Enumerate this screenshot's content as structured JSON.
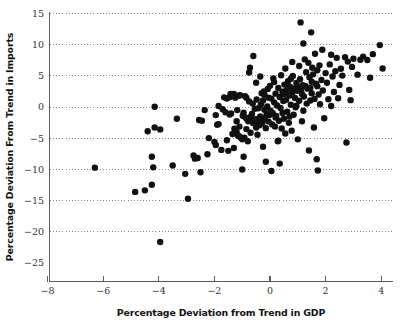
{
  "chart_data": {
    "type": "scatter",
    "title": "",
    "xlabel": "Percentage Deviation from Trend in GDP",
    "ylabel": "Percentage Deviation From Trend in Imports",
    "xlim": [
      -8,
      4.7
    ],
    "ylim": [
      -25,
      15.8
    ],
    "xticks": [
      -8,
      -6,
      -4,
      -2,
      0,
      2,
      4
    ],
    "xticklabels": [
      "−8",
      "−6",
      "−4",
      "−2",
      "0",
      "2",
      "4"
    ],
    "yticks": [
      15,
      10,
      5,
      0,
      -5,
      -10,
      -15,
      -20,
      -25
    ],
    "yticklabels": [
      "15",
      "10",
      "5",
      "0",
      "−5",
      "−10",
      "−15",
      "−20",
      "−25"
    ],
    "grid": "horizontal-dotted",
    "gridded_values": [
      15,
      10,
      5,
      0,
      -5,
      -10,
      -15,
      -20
    ],
    "legend": "none",
    "marker": "filled-circle",
    "marker_color": "#111111",
    "marker_size_px": 3.2,
    "n_points": 233,
    "points": [
      [
        -6.3,
        -9.75
      ],
      [
        -4.85,
        -13.65
      ],
      [
        -4.5,
        -13.4
      ],
      [
        -4.25,
        -12.5
      ],
      [
        -4.15,
        -3.3
      ],
      [
        -4.4,
        -3.9
      ],
      [
        -4.15,
        0.05
      ],
      [
        -4.2,
        -9.7
      ],
      [
        -4.25,
        -8.0
      ],
      [
        -3.95,
        -21.7
      ],
      [
        -3.95,
        -3.6
      ],
      [
        -3.5,
        -9.4
      ],
      [
        -3.35,
        -1.9
      ],
      [
        -3.05,
        -10.75
      ],
      [
        -2.95,
        -14.75
      ],
      [
        -2.75,
        -7.8
      ],
      [
        -2.7,
        -8.3
      ],
      [
        -2.6,
        -8.2
      ],
      [
        -2.55,
        -2.1
      ],
      [
        -2.5,
        -10.5
      ],
      [
        -2.35,
        -0.5
      ],
      [
        -2.25,
        -7.6
      ],
      [
        -2.0,
        -5.6
      ],
      [
        -1.95,
        -1.3
      ],
      [
        -1.9,
        -2.85
      ],
      [
        -1.85,
        -2.75
      ],
      [
        -1.75,
        -6.9
      ],
      [
        -1.7,
        -0.35
      ],
      [
        -1.65,
        1.55
      ],
      [
        -1.6,
        -0.85
      ],
      [
        -1.55,
        -5.35
      ],
      [
        -1.5,
        -7.05
      ],
      [
        -1.45,
        1.6
      ],
      [
        -1.42,
        2.1
      ],
      [
        -1.4,
        -1.05
      ],
      [
        -1.35,
        -4.35
      ],
      [
        -1.3,
        -6.6
      ],
      [
        -1.28,
        -3.5
      ],
      [
        -1.25,
        1.5
      ],
      [
        -1.2,
        -4.0
      ],
      [
        -1.18,
        -0.5
      ],
      [
        -1.15,
        -4.6
      ],
      [
        -1.12,
        -4.7
      ],
      [
        -1.1,
        1.85
      ],
      [
        -1.08,
        1.9
      ],
      [
        -1.05,
        -4.9
      ],
      [
        -1.0,
        -5.2
      ],
      [
        -0.98,
        -1.4
      ],
      [
        -1.0,
        -10.05
      ],
      [
        -0.95,
        -8.0
      ],
      [
        -0.92,
        -4.95
      ],
      [
        -0.9,
        1.75
      ],
      [
        -0.88,
        -1.7
      ],
      [
        -0.85,
        1.5
      ],
      [
        -0.82,
        -2.0
      ],
      [
        -0.8,
        -5.5
      ],
      [
        -0.78,
        -2.3
      ],
      [
        -0.75,
        5.55
      ],
      [
        -0.72,
        6.3
      ],
      [
        -0.7,
        -1.6
      ],
      [
        -0.68,
        -2.1
      ],
      [
        -0.65,
        -1.1
      ],
      [
        -0.62,
        0.55
      ],
      [
        -0.6,
        -2.6
      ],
      [
        -0.58,
        -2.4
      ],
      [
        -0.55,
        -2.5
      ],
      [
        -0.52,
        -1.95
      ],
      [
        -0.5,
        -3.3
      ],
      [
        -0.48,
        1.2
      ],
      [
        -0.45,
        -2.2
      ],
      [
        -0.42,
        -0.2
      ],
      [
        -0.4,
        -1.85
      ],
      [
        -0.38,
        -2.95
      ],
      [
        -0.35,
        -1.5
      ],
      [
        -0.33,
        0.4
      ],
      [
        -0.3,
        -1.75
      ],
      [
        -0.28,
        -2.65
      ],
      [
        -0.25,
        1.05
      ],
      [
        -0.22,
        2.5
      ],
      [
        -0.2,
        -0.45
      ],
      [
        -0.18,
        -2.0
      ],
      [
        -0.15,
        -3.4
      ],
      [
        -0.12,
        -1.15
      ],
      [
        -0.1,
        0.1
      ],
      [
        -0.08,
        2.9
      ],
      [
        -0.05,
        -2.35
      ],
      [
        -0.02,
        -1.3
      ],
      [
        0.0,
        3.4
      ],
      [
        0.02,
        -0.6
      ],
      [
        0.05,
        1.35
      ],
      [
        0.08,
        -2.8
      ],
      [
        0.1,
        -1.0
      ],
      [
        0.12,
        4.6
      ],
      [
        0.15,
        0.75
      ],
      [
        0.18,
        -3.15
      ],
      [
        0.2,
        2.15
      ],
      [
        0.22,
        -1.45
      ],
      [
        0.25,
        0.25
      ],
      [
        0.28,
        -5.5
      ],
      [
        0.3,
        3.05
      ],
      [
        0.32,
        -2.2
      ],
      [
        0.35,
        1.6
      ],
      [
        0.38,
        -0.15
      ],
      [
        0.4,
        5.1
      ],
      [
        0.42,
        -3.45
      ],
      [
        0.45,
        2.45
      ],
      [
        0.48,
        0.95
      ],
      [
        0.5,
        -1.9
      ],
      [
        0.52,
        3.6
      ],
      [
        0.55,
        -4.25
      ],
      [
        0.58,
        1.15
      ],
      [
        0.6,
        2.75
      ],
      [
        0.62,
        -0.75
      ],
      [
        0.65,
        4.15
      ],
      [
        0.68,
        -2.55
      ],
      [
        0.7,
        1.85
      ],
      [
        0.72,
        3.25
      ],
      [
        0.75,
        0.35
      ],
      [
        0.78,
        -3.8
      ],
      [
        0.8,
        2.35
      ],
      [
        0.82,
        5.0
      ],
      [
        0.85,
        -1.25
      ],
      [
        0.88,
        3.0
      ],
      [
        0.9,
        1.45
      ],
      [
        0.92,
        -0.05
      ],
      [
        0.95,
        3.85
      ],
      [
        0.98,
        2.6
      ],
      [
        1.0,
        -5.2
      ],
      [
        1.02,
        3.2
      ],
      [
        1.05,
        1.0
      ],
      [
        1.08,
        4.45
      ],
      [
        1.1,
        13.6
      ],
      [
        1.12,
        2.85
      ],
      [
        1.15,
        -2.3
      ],
      [
        1.18,
        3.5
      ],
      [
        1.2,
        10.2
      ],
      [
        1.22,
        1.7
      ],
      [
        1.25,
        7.65
      ],
      [
        1.28,
        3.35
      ],
      [
        1.3,
        5.6
      ],
      [
        1.32,
        0.55
      ],
      [
        1.35,
        2.95
      ],
      [
        1.38,
        7.1
      ],
      [
        1.4,
        -7.0
      ],
      [
        1.42,
        4.8
      ],
      [
        1.45,
        3.1
      ],
      [
        1.48,
        12.0
      ],
      [
        1.5,
        2.2
      ],
      [
        1.52,
        6.3
      ],
      [
        1.55,
        5.25
      ],
      [
        1.58,
        -3.3
      ],
      [
        1.6,
        1.3
      ],
      [
        1.62,
        8.55
      ],
      [
        1.65,
        3.75
      ],
      [
        1.68,
        -8.4
      ],
      [
        1.7,
        5.9
      ],
      [
        1.72,
        -10.2
      ],
      [
        1.75,
        2.0
      ],
      [
        1.78,
        6.7
      ],
      [
        1.8,
        0.45
      ],
      [
        1.85,
        4.35
      ],
      [
        1.88,
        9.2
      ],
      [
        1.9,
        2.65
      ],
      [
        1.95,
        -1.8
      ],
      [
        2.0,
        5.45
      ],
      [
        2.05,
        3.9
      ],
      [
        2.1,
        1.25
      ],
      [
        2.15,
        6.85
      ],
      [
        2.2,
        0.15
      ],
      [
        2.25,
        4.9
      ],
      [
        2.3,
        2.4
      ],
      [
        2.35,
        5.75
      ],
      [
        2.4,
        7.9
      ],
      [
        2.5,
        3.55
      ],
      [
        2.55,
        6.15
      ],
      [
        2.6,
        5.05
      ],
      [
        2.7,
        8.0
      ],
      [
        2.75,
        -5.7
      ],
      [
        2.8,
        7.3
      ],
      [
        2.85,
        2.75
      ],
      [
        2.9,
        1.1
      ],
      [
        2.95,
        6.45
      ],
      [
        3.0,
        7.75
      ],
      [
        3.15,
        5.2
      ],
      [
        3.25,
        7.6
      ],
      [
        3.35,
        8.1
      ],
      [
        3.5,
        7.55
      ],
      [
        3.6,
        4.7
      ],
      [
        3.7,
        8.5
      ],
      [
        3.95,
        9.95
      ],
      [
        4.05,
        6.2
      ],
      [
        -0.6,
        8.2
      ],
      [
        -0.35,
        4.9
      ],
      [
        -0.5,
        3.9
      ],
      [
        -0.25,
        -6.4
      ],
      [
        -0.15,
        -8.8
      ],
      [
        0.05,
        -10.3
      ],
      [
        0.3,
        -5.4
      ],
      [
        0.55,
        6.2
      ],
      [
        0.8,
        7.25
      ],
      [
        1.05,
        6.6
      ],
      [
        -1.3,
        2.1
      ],
      [
        -1.55,
        1.35
      ],
      [
        -1.1,
        -3.15
      ],
      [
        -0.85,
        -3.55
      ],
      [
        -0.7,
        -4.15
      ],
      [
        -0.45,
        -4.45
      ],
      [
        -0.2,
        1.95
      ],
      [
        0.15,
        4.0
      ],
      [
        0.45,
        -0.95
      ],
      [
        0.7,
        -1.55
      ],
      [
        0.95,
        0.2
      ],
      [
        1.2,
        -0.6
      ],
      [
        1.45,
        1.05
      ],
      [
        1.7,
        3.35
      ],
      [
        -1.45,
        -1.2
      ],
      [
        -1.2,
        -2.3
      ],
      [
        -0.95,
        -0.9
      ],
      [
        -0.75,
        0.9
      ],
      [
        -0.55,
        -0.3
      ],
      [
        -0.3,
        2.2
      ],
      [
        -0.05,
        1.5
      ],
      [
        0.2,
        -1.7
      ],
      [
        0.5,
        2.05
      ],
      [
        0.75,
        4.55
      ],
      [
        1.15,
        2.1
      ],
      [
        1.5,
        4.05
      ],
      [
        -2.2,
        -5.0
      ],
      [
        -1.95,
        -6.1
      ],
      [
        2.45,
        1.4
      ],
      [
        2.2,
        8.4
      ],
      [
        -1.85,
        0.15
      ],
      [
        -2.45,
        -2.2
      ],
      [
        0.35,
        -9.1
      ]
    ]
  },
  "figure": {
    "background": "#ffffff",
    "axis_color": "#5b5b5b",
    "grid_color": "#8a8a8a",
    "text_color": "#111111"
  }
}
